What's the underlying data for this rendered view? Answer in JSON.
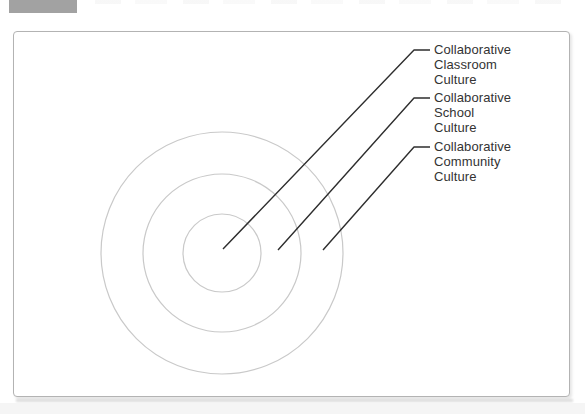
{
  "page": {
    "figure_badge": {
      "description": "gray figure-number box cropped at top edge, text not visible",
      "color": "#a2a2a2"
    },
    "panel": {
      "background": "#ffffff",
      "border_color": "#b3b3b3"
    }
  },
  "diagram": {
    "type": "concentric-rings",
    "rings": [
      {
        "name": "inner-ring",
        "label_lines": [
          "Collaborative",
          "Classroom",
          "Culture"
        ]
      },
      {
        "name": "middle-ring",
        "label_lines": [
          "Collaborative",
          "School",
          "Culture"
        ]
      },
      {
        "name": "outer-ring",
        "label_lines": [
          "Collaborative",
          "Community",
          "Culture"
        ]
      }
    ],
    "colors": {
      "ring_stroke": "#c9c9c9",
      "leader_line": "#2e2e2e",
      "label_text": "#333333",
      "badge_gray": "#a2a2a2",
      "panel_border": "#b3b3b3"
    }
  }
}
